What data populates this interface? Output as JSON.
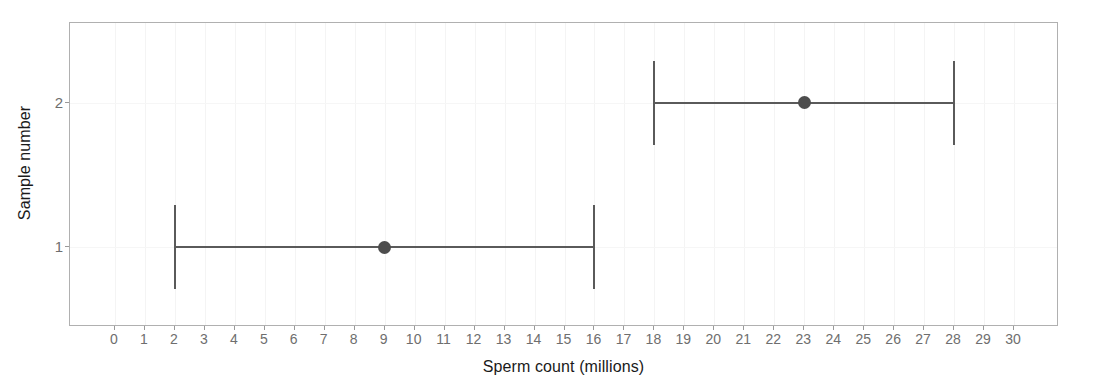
{
  "chart_data": {
    "type": "scatter",
    "title": "",
    "xlabel": "Sperm count (millions)",
    "ylabel": "Sample number",
    "xlim": [
      -1.5,
      31.5
    ],
    "ylim": [
      0.45,
      2.55
    ],
    "grid": true,
    "legend": null,
    "x_ticks": [
      0,
      1,
      2,
      3,
      4,
      5,
      6,
      7,
      8,
      9,
      10,
      11,
      12,
      13,
      14,
      15,
      16,
      17,
      18,
      19,
      20,
      21,
      22,
      23,
      24,
      25,
      26,
      27,
      28,
      29,
      30
    ],
    "x_tick_labels": [
      "0",
      "1",
      "2",
      "3",
      "4",
      "5",
      "6",
      "7",
      "8",
      "9",
      "10",
      "11",
      "12",
      "13",
      "14",
      "15",
      "16",
      "17",
      "18",
      "19",
      "20",
      "21",
      "22",
      "23",
      "24",
      "25",
      "26",
      "27",
      "28",
      "29",
      "30"
    ],
    "y_ticks": [
      1,
      2
    ],
    "y_tick_labels": [
      "1",
      "2"
    ],
    "orientation": "horizontal",
    "marker_color": "#4d4d4d",
    "errorbar_color": "#5a5a5a",
    "panel_border_color": "#b0b0b0",
    "points": [
      {
        "sample": 1,
        "y": 1,
        "x": 9,
        "xmin": 2,
        "xmax": 16,
        "label": "Sample 1"
      },
      {
        "sample": 2,
        "y": 2,
        "x": 23,
        "xmin": 18,
        "xmax": 28,
        "label": "Sample 2"
      }
    ]
  }
}
